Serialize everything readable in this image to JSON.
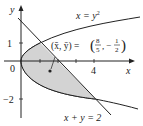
{
  "figure": {
    "type": "region-centroid",
    "curves": [
      {
        "label": "x = y²",
        "equation": "x = y^2"
      },
      {
        "label": "x + y = 2",
        "equation": "x + y = 2"
      }
    ],
    "region_fill": "#d3d3d3",
    "intersection_points": [
      [
        1,
        1
      ],
      [
        4,
        -2
      ]
    ],
    "centroid": {
      "label": "(x̄, ȳ) = (8/5, −1/2)",
      "x": 1.6,
      "y": -0.5
    },
    "axes": {
      "x_label": "x",
      "y_label": "y",
      "origin_label": "0",
      "x_tick_labels": [
        "4"
      ],
      "y_tick_labels": [
        "1",
        "−2"
      ]
    }
  },
  "labels": {
    "y_axis": "y",
    "x_axis": "x",
    "origin": "0",
    "tick_x4": "4",
    "tick_y1": "1",
    "tick_ym2": "−2",
    "parabola_lhs": "x = y",
    "parabola_exp": "2",
    "line": "x + y = 2",
    "centroid_lhs": "(x̄, ȳ) =",
    "frac1_num": "8",
    "frac1_den": "5",
    "frac2_sign": "−",
    "frac2_num": "1",
    "frac2_den": "2"
  }
}
